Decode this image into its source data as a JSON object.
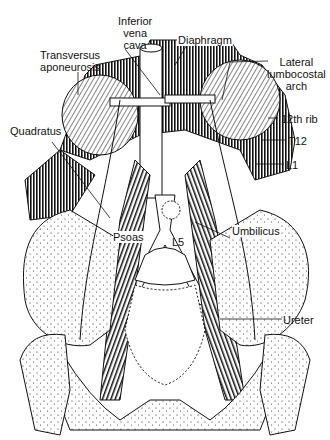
{
  "figure": {
    "labels": {
      "inferior_vena_cava": [
        "Inferior",
        "vena",
        "cava"
      ],
      "diaphragm": "Diaphragm",
      "transversus": [
        "Transversus",
        "aponeurosis"
      ],
      "lateral_arch": [
        "Lateral",
        "lumbocostal",
        "arch"
      ],
      "rib12": "12th rib",
      "t12": "T12",
      "l1": "L1",
      "quadratus": "Quadratus",
      "umbilicus": "Umbilicus",
      "psoas": "Psoas",
      "l5": "L5",
      "ureter": "Ureter"
    },
    "colors": {
      "ink": "#111111",
      "background": "#ffffff"
    }
  }
}
